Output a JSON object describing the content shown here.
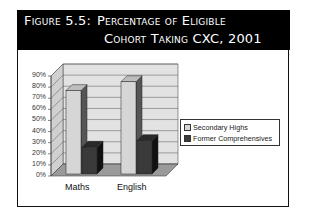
{
  "figure": {
    "title_line1_prefix": "Figure 5.5:",
    "title_line1": "Percentage of Eligible",
    "title_line2": "Cohort Taking CXC, 2001"
  },
  "chart_data": {
    "type": "bar",
    "style": "3d-clustered-column",
    "categories": [
      "Maths",
      "English"
    ],
    "series": [
      {
        "name": "Secondary Highs",
        "values": [
          75,
          83
        ],
        "color": "#d6d6d6"
      },
      {
        "name": "Former Comprehensives",
        "values": [
          24,
          30
        ],
        "color": "#3a3a3a"
      }
    ],
    "xlabel": "",
    "ylabel": "",
    "yticks": [
      "0%",
      "10%",
      "20%",
      "30%",
      "40%",
      "50%",
      "60%",
      "70%",
      "80%",
      "90%"
    ],
    "ylim": [
      0,
      90
    ],
    "grid": true,
    "legend_position": "right"
  },
  "legend": {
    "items": [
      {
        "label": "Secondary Highs",
        "color": "#d6d6d6"
      },
      {
        "label": "Former Comprehensives",
        "color": "#3a3a3a"
      }
    ]
  },
  "axis": {
    "y_labels": [
      "0%",
      "10%",
      "20%",
      "30%",
      "40%",
      "50%",
      "60%",
      "70%",
      "80%",
      "90%"
    ],
    "x_labels": [
      "Maths",
      "English"
    ]
  }
}
